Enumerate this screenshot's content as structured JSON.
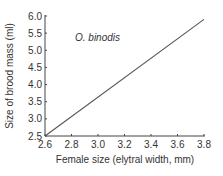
{
  "chart_data": {
    "type": "line",
    "title": "",
    "xlabel": "Female size (elytral width, mm)",
    "ylabel": "Size of brood mass (ml)",
    "xlim": [
      2.6,
      3.8
    ],
    "ylim": [
      2.5,
      6.0
    ],
    "x_ticks": [
      "2.6",
      "2.8",
      "3.0",
      "3.2",
      "3.4",
      "3.6",
      "3.8"
    ],
    "y_ticks": [
      "2.5",
      "3.0",
      "3.5",
      "4.0",
      "4.5",
      "5.0",
      "5.5",
      "6.0"
    ],
    "grid": false,
    "legend": null,
    "annotations": [
      "O. binodis"
    ],
    "series": [
      {
        "name": "O. binodis",
        "x": [
          2.6,
          3.8
        ],
        "y": [
          2.5,
          5.9
        ],
        "color": "#555555"
      }
    ]
  },
  "colors": {
    "axis": "#444444",
    "line": "#555555",
    "text": "#333333"
  }
}
